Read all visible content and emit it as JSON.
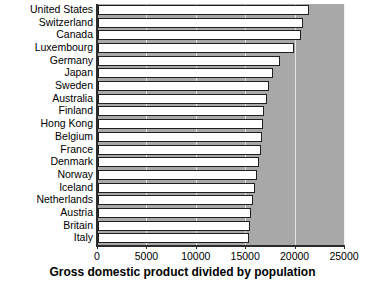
{
  "chart_data": {
    "type": "bar",
    "orientation": "horizontal",
    "title": "",
    "xlabel": "Gross domestic product divided by population",
    "ylabel": "",
    "xlim": [
      0,
      25000
    ],
    "ylim": null,
    "xticks": [
      "0",
      "5000",
      "10000",
      "15000",
      "20000",
      "25000"
    ],
    "xtick_values": [
      0,
      5000,
      10000,
      15000,
      20000,
      25000
    ],
    "grid": true,
    "grid_axis": "x",
    "legend": null,
    "legend_position": "none",
    "plot_background": "#a8a8a8",
    "bar_fill": "#ffffff",
    "bar_edge": "#1f1f1f",
    "bar_shadow": "#5c5c5c",
    "categories": [
      "United States",
      "Switzerland",
      "Canada",
      "Luxembourg",
      "Germany",
      "Japan",
      "Sweden",
      "Australia",
      "Finland",
      "Hong Kong",
      "Belgium",
      "France",
      "Denmark",
      "Norway",
      "Iceland",
      "Netherlands",
      "Austria",
      "Britain",
      "Italy"
    ],
    "values": [
      21400,
      20700,
      20500,
      19800,
      18400,
      17700,
      17300,
      17100,
      16800,
      16700,
      16600,
      16500,
      16300,
      16100,
      15900,
      15700,
      15500,
      15400,
      15300
    ]
  }
}
